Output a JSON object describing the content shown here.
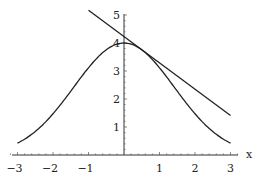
{
  "chart_data": {
    "type": "line",
    "title": "",
    "xlabel": "x",
    "ylabel": "",
    "xlim": [
      -3.2,
      3.2
    ],
    "ylim": [
      0,
      5.2
    ],
    "xticks": [
      -3,
      -2,
      -1,
      1,
      2,
      3
    ],
    "yticks": [
      1,
      2,
      3,
      4,
      5
    ],
    "grid": false,
    "series": [
      {
        "name": "curve",
        "description": "bell curve 4·exp(-x²/4)",
        "x": [
          -3,
          -2.5,
          -2,
          -1.5,
          -1,
          -0.5,
          0,
          0.5,
          1,
          1.5,
          2,
          2.5,
          3
        ],
        "y": [
          0.42,
          0.84,
          1.47,
          2.28,
          3.12,
          3.76,
          4.0,
          3.76,
          3.12,
          2.28,
          1.47,
          0.84,
          0.42
        ]
      },
      {
        "name": "tangent line",
        "description": "tangent to curve near x=0.5",
        "x": [
          -1,
          3
        ],
        "y": [
          5.17,
          1.41
        ]
      }
    ]
  }
}
